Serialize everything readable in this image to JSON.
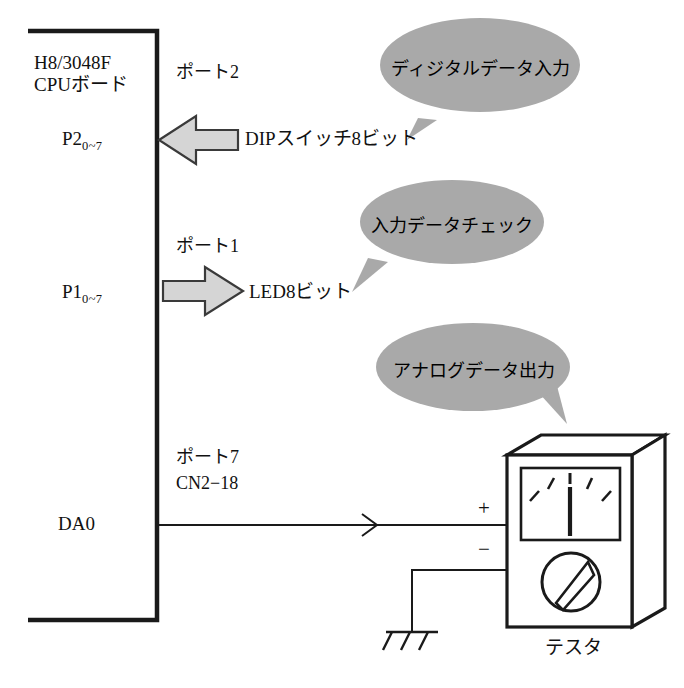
{
  "diagram": {
    "title_present": false,
    "colors": {
      "line": "#1a1a1a",
      "bubble_fill": "#a9a9a9",
      "arrow_fill": "#d5d5d5",
      "background": "#ffffff"
    },
    "board": {
      "name_line1": "H8/3048F",
      "name_line2": "CPUボード"
    },
    "ports": [
      {
        "id": "port2",
        "port_label": "ポート2",
        "pin_base": "P2",
        "pin_sub": "0~7",
        "direction": "input",
        "peripheral": "DIPスイッチ8ビット"
      },
      {
        "id": "port1",
        "port_label": "ポート1",
        "pin_base": "P1",
        "pin_sub": "0~7",
        "direction": "output",
        "peripheral": "LED8ビット"
      },
      {
        "id": "port7",
        "port_label": "ポート7",
        "connector": "CN2−18",
        "pin_base": "DA0",
        "direction": "output",
        "peripheral": "テスタ"
      }
    ],
    "callouts": [
      {
        "id": "callout-digital-input",
        "text": "ディジタルデータ入力",
        "tail": "down-left"
      },
      {
        "id": "callout-input-check",
        "text": "入力データチェック",
        "tail": "down-left"
      },
      {
        "id": "callout-analog-output",
        "text": "アナログデータ出力",
        "tail": "down-right"
      }
    ],
    "tester": {
      "caption": "テスタ",
      "terminal_plus": "+",
      "terminal_minus": "−",
      "meter_ticks": 5,
      "has_needle": true,
      "has_knob": true,
      "has_ground": true
    }
  }
}
